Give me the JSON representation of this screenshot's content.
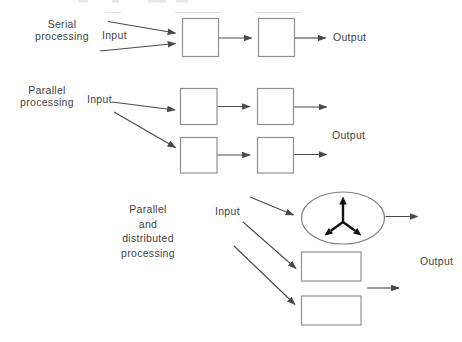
{
  "diagram": {
    "sections": {
      "serial": {
        "label": [
          "Serial",
          "processing"
        ],
        "input": "Input",
        "output": "Output",
        "stages": 2
      },
      "parallel": {
        "label": [
          "Parallel",
          "processing"
        ],
        "input": "Input",
        "output": "Output",
        "branches": 2,
        "stages_per_branch": 2
      },
      "distributed": {
        "label": [
          "Parallel",
          "and",
          "distributed",
          "processing"
        ],
        "input": "Input",
        "output": "Output",
        "nodes": 3
      }
    },
    "colors": {
      "background": "#ffffff",
      "arrow_line": "#4a4a4a",
      "box_border": "#8f8f8f",
      "ellipse_border": "#7f7f7f",
      "hub_symbol": "#111111",
      "text": "#3f3f3f"
    }
  }
}
